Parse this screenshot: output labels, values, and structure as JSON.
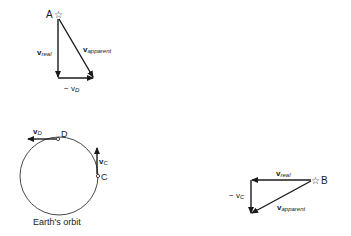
{
  "diagram": {
    "point_a": {
      "label": "A",
      "vec_real": "v",
      "vec_real_sub": "real",
      "vec_apparent": "v",
      "vec_apparent_sub": "apparent",
      "neg_vd": "− v",
      "neg_vd_sub": "D"
    },
    "orbit": {
      "caption": "Earth's orbit",
      "point_d": "D",
      "point_c": "C",
      "vd": "v",
      "vd_sub": "D",
      "vc": "v",
      "vc_sub": "C"
    },
    "point_b": {
      "label": "B",
      "vec_real": "v",
      "vec_real_sub": "real",
      "vec_apparent": "v",
      "vec_apparent_sub": "apparent",
      "neg_vc": "− v",
      "neg_vc_sub": "C"
    },
    "colors": {
      "ink": "#1a1a1a",
      "background": "#ffffff"
    }
  }
}
